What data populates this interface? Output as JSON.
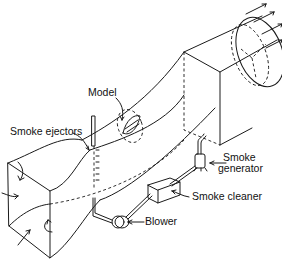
{
  "diagram": {
    "labels": {
      "model": "Model",
      "smoke_ejectors": "Smoke ejectors",
      "smoke_generator_line1": "Smoke",
      "smoke_generator_line2": "generator",
      "smoke_cleaner": "Smoke cleaner",
      "blower": "Blower"
    },
    "components": [
      "Inlet contraction (square section)",
      "Test section with model",
      "Smoke ejectors rake",
      "Diffuser to circular exit with fan",
      "Smoke generator",
      "Smoke cleaner",
      "Blower"
    ],
    "colors": {
      "line": "#1a1a1a",
      "background": "#ffffff"
    }
  }
}
